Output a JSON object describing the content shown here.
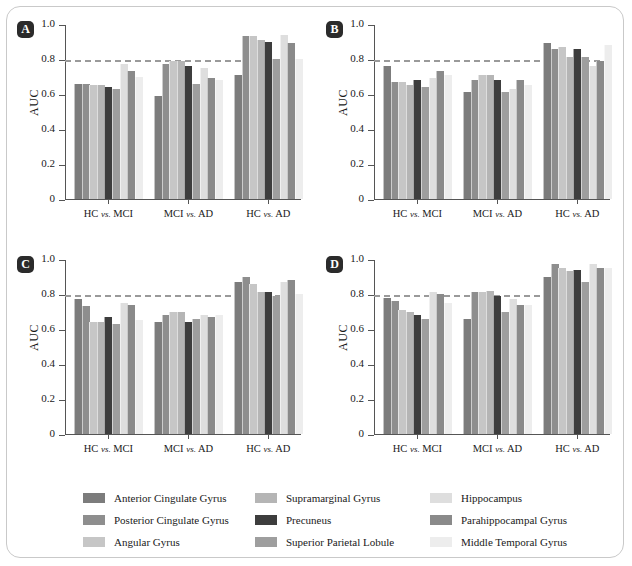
{
  "figure": {
    "y_axis_title": "AUC",
    "y_ticks": [
      "0",
      "0.2",
      "0.4",
      "0.6",
      "0.8",
      "1.0"
    ],
    "y_tick_values": [
      0,
      0.2,
      0.4,
      0.6,
      0.8,
      1.0
    ],
    "threshold": 0.8,
    "groups": [
      {
        "prefix": "HC ",
        "italic": "vs.",
        "suffix": " MCI"
      },
      {
        "prefix": "MCI ",
        "italic": "vs.",
        "suffix": " AD"
      },
      {
        "prefix": "HC ",
        "italic": "vs.",
        "suffix": " AD"
      }
    ],
    "panels": [
      {
        "label": "A"
      },
      {
        "label": "B"
      },
      {
        "label": "C"
      },
      {
        "label": "D"
      }
    ]
  },
  "legend": {
    "items": [
      {
        "label": "Anterior Cingulate Gyrus",
        "color": "#7c7c7c"
      },
      {
        "label": "Supramarginal Gyrus",
        "color": "#b5b5b5"
      },
      {
        "label": "Hippocampus",
        "color": "#dedede"
      },
      {
        "label": "Posterior Cingulate Gyrus",
        "color": "#8e8e8e"
      },
      {
        "label": "Precuneus",
        "color": "#3d3d3d"
      },
      {
        "label": "Parahippocampal Gyrus",
        "color": "#8a8a8a"
      },
      {
        "label": "Angular Gyrus",
        "color": "#c6c6c6"
      },
      {
        "label": "Superior Parietal Lobule",
        "color": "#9e9e9e"
      },
      {
        "label": "Middle Temporal Gyrus",
        "color": "#ededed"
      }
    ]
  },
  "chart_data": {
    "type": "bar",
    "title": "",
    "xlabel": "",
    "ylabel": "AUC",
    "ylim": [
      0,
      1.0
    ],
    "yticks": [
      0,
      0.2,
      0.4,
      0.6,
      0.8,
      1.0
    ],
    "grid": false,
    "legend_position": "bottom",
    "annotations": [
      {
        "type": "hline",
        "y": 0.8,
        "style": "dashed",
        "color": "#9a9a9a"
      }
    ],
    "categories": [
      "HC vs. MCI",
      "MCI vs. AD",
      "HC vs. AD"
    ],
    "series_names": [
      "Anterior Cingulate Gyrus",
      "Posterior Cingulate Gyrus",
      "Angular Gyrus",
      "Supramarginal Gyrus",
      "Precuneus",
      "Superior Parietal Lobule",
      "Hippocampus",
      "Parahippocampal Gyrus",
      "Middle Temporal Gyrus"
    ],
    "series_colors": [
      "#7c7c7c",
      "#8e8e8e",
      "#c6c6c6",
      "#b5b5b5",
      "#3d3d3d",
      "#9e9e9e",
      "#dedede",
      "#8a8a8a",
      "#ededed"
    ],
    "panels": [
      {
        "label": "A",
        "series": [
          {
            "name": "Anterior Cingulate Gyrus",
            "values": [
              0.66,
              0.59,
              0.71
            ]
          },
          {
            "name": "Posterior Cingulate Gyrus",
            "values": [
              0.66,
              0.77,
              0.93
            ]
          },
          {
            "name": "Angular Gyrus",
            "values": [
              0.65,
              0.79,
              0.93
            ]
          },
          {
            "name": "Supramarginal Gyrus",
            "values": [
              0.65,
              0.79,
              0.91
            ]
          },
          {
            "name": "Precuneus",
            "values": [
              0.64,
              0.76,
              0.9
            ]
          },
          {
            "name": "Superior Parietal Lobule",
            "values": [
              0.63,
              0.66,
              0.8
            ]
          },
          {
            "name": "Hippocampus",
            "values": [
              0.77,
              0.75,
              0.94
            ]
          },
          {
            "name": "Parahippocampal Gyrus",
            "values": [
              0.73,
              0.69,
              0.89
            ]
          },
          {
            "name": "Middle Temporal Gyrus",
            "values": [
              0.7,
              0.68,
              0.8
            ]
          }
        ]
      },
      {
        "label": "B",
        "series": [
          {
            "name": "Anterior Cingulate Gyrus",
            "values": [
              0.76,
              0.61,
              0.89
            ]
          },
          {
            "name": "Posterior Cingulate Gyrus",
            "values": [
              0.67,
              0.68,
              0.86
            ]
          },
          {
            "name": "Angular Gyrus",
            "values": [
              0.67,
              0.71,
              0.87
            ]
          },
          {
            "name": "Supramarginal Gyrus",
            "values": [
              0.65,
              0.71,
              0.81
            ]
          },
          {
            "name": "Precuneus",
            "values": [
              0.68,
              0.68,
              0.86
            ]
          },
          {
            "name": "Superior Parietal Lobule",
            "values": [
              0.64,
              0.61,
              0.81
            ]
          },
          {
            "name": "Hippocampus",
            "values": [
              0.69,
              0.63,
              0.76
            ]
          },
          {
            "name": "Parahippocampal Gyrus",
            "values": [
              0.73,
              0.68,
              0.79
            ]
          },
          {
            "name": "Middle Temporal Gyrus",
            "values": [
              0.71,
              0.65,
              0.88
            ]
          }
        ]
      },
      {
        "label": "C",
        "series": [
          {
            "name": "Anterior Cingulate Gyrus",
            "values": [
              0.77,
              0.64,
              0.87
            ]
          },
          {
            "name": "Posterior Cingulate Gyrus",
            "values": [
              0.73,
              0.68,
              0.9
            ]
          },
          {
            "name": "Angular Gyrus",
            "values": [
              0.64,
              0.7,
              0.86
            ]
          },
          {
            "name": "Supramarginal Gyrus",
            "values": [
              0.64,
              0.7,
              0.81
            ]
          },
          {
            "name": "Precuneus",
            "values": [
              0.67,
              0.64,
              0.81
            ]
          },
          {
            "name": "Superior Parietal Lobule",
            "values": [
              0.63,
              0.66,
              0.79
            ]
          },
          {
            "name": "Hippocampus",
            "values": [
              0.75,
              0.68,
              0.87
            ]
          },
          {
            "name": "Parahippocampal Gyrus",
            "values": [
              0.74,
              0.67,
              0.88
            ]
          },
          {
            "name": "Middle Temporal Gyrus",
            "values": [
              0.65,
              0.68,
              0.8
            ]
          }
        ]
      },
      {
        "label": "D",
        "series": [
          {
            "name": "Anterior Cingulate Gyrus",
            "values": [
              0.78,
              0.66,
              0.9
            ]
          },
          {
            "name": "Posterior Cingulate Gyrus",
            "values": [
              0.76,
              0.81,
              0.97
            ]
          },
          {
            "name": "Angular Gyrus",
            "values": [
              0.71,
              0.81,
              0.95
            ]
          },
          {
            "name": "Supramarginal Gyrus",
            "values": [
              0.7,
              0.82,
              0.93
            ]
          },
          {
            "name": "Precuneus",
            "values": [
              0.68,
              0.79,
              0.94
            ]
          },
          {
            "name": "Superior Parietal Lobule",
            "values": [
              0.66,
              0.7,
              0.87
            ]
          },
          {
            "name": "Hippocampus",
            "values": [
              0.81,
              0.77,
              0.97
            ]
          },
          {
            "name": "Parahippocampal Gyrus",
            "values": [
              0.8,
              0.74,
              0.95
            ]
          },
          {
            "name": "Middle Temporal Gyrus",
            "values": [
              0.75,
              0.74,
              0.95
            ]
          }
        ]
      }
    ]
  }
}
